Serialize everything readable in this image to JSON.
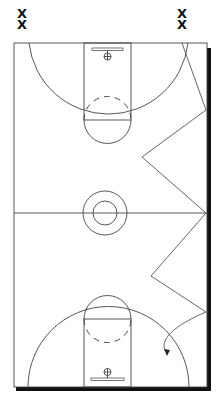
{
  "diagram": {
    "type": "basketball-half-court-drill",
    "colors": {
      "line": "#444444",
      "shadow": "#111111",
      "marker": "#111111",
      "background": "#ffffff"
    },
    "markers": [
      {
        "id": "left-top",
        "label": "X",
        "x": 22,
        "y": 14
      },
      {
        "id": "left-bottom",
        "label": "X",
        "x": 22,
        "y": 25
      },
      {
        "id": "right-top",
        "label": "X",
        "x": 182,
        "y": 14
      },
      {
        "id": "right-bottom",
        "label": "X",
        "x": 182,
        "y": 25
      }
    ],
    "path": {
      "kind": "zigzag-dribble",
      "points": [
        [
          182,
          43
        ],
        [
          206,
          110
        ],
        [
          142,
          157
        ],
        [
          206,
          213
        ],
        [
          151,
          276
        ],
        [
          206,
          312
        ]
      ],
      "ends_with": "arrow",
      "arrow_end": [
        167,
        355
      ]
    }
  }
}
